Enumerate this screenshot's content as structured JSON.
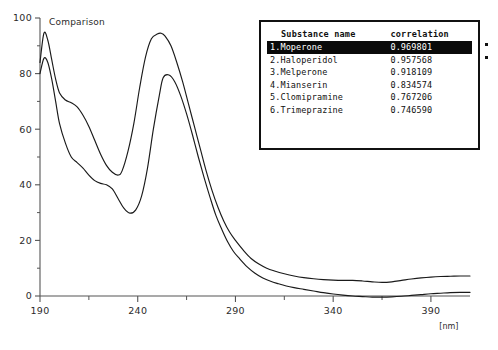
{
  "chart_data": {
    "type": "line",
    "title": "Comparison",
    "xlabel": "[nm]",
    "ylabel": "",
    "xlim": [
      190,
      410
    ],
    "ylim": [
      0,
      100
    ],
    "grid": false,
    "legend_position": "none",
    "x_ticks": [
      190,
      240,
      290,
      340,
      390
    ],
    "x_minor_step": 25,
    "y_ticks": [
      0,
      20,
      40,
      60,
      80,
      100
    ],
    "y_minor_step": 10,
    "series": [
      {
        "name": "Moperone (reference, upper)",
        "color": "#1a1a1a",
        "x": [
          190,
          192,
          194,
          196,
          198,
          200,
          203,
          206,
          209,
          212,
          215,
          218,
          221,
          224,
          227,
          230,
          232,
          235,
          238,
          241,
          244,
          247,
          250,
          252,
          254,
          257,
          260,
          263,
          266,
          269,
          272,
          275,
          278,
          281,
          284,
          287,
          290,
          294,
          298,
          302,
          306,
          310,
          315,
          320,
          325,
          330,
          335,
          340,
          345,
          350,
          355,
          360,
          365,
          370,
          375,
          380,
          385,
          390,
          395,
          400,
          405,
          410
        ],
        "y": [
          84,
          94.5,
          92,
          85,
          78,
          73,
          70.5,
          69.5,
          68,
          65,
          61,
          56,
          51,
          47,
          44.5,
          43.5,
          45,
          52,
          62,
          75,
          86,
          92.5,
          94.2,
          94.5,
          93.5,
          90,
          84,
          77,
          69,
          61,
          53,
          45,
          38,
          32,
          27,
          23,
          20,
          16.5,
          13.5,
          11.5,
          10,
          9,
          8,
          7.2,
          6.6,
          6.2,
          5.9,
          5.7,
          5.6,
          5.6,
          5.4,
          5.1,
          4.9,
          5.1,
          5.6,
          6.1,
          6.5,
          6.8,
          7.0,
          7.1,
          7.2,
          7.2
        ]
      },
      {
        "name": "Haloperidol (sample, lower)",
        "color": "#1a1a1a",
        "x": [
          190,
          192,
          194,
          196,
          198,
          200,
          203,
          206,
          209,
          212,
          215,
          218,
          221,
          224,
          227,
          230,
          233,
          236,
          239,
          242,
          245,
          248,
          251,
          253,
          256,
          259,
          262,
          265,
          268,
          271,
          274,
          277,
          280,
          283,
          286,
          289,
          292,
          296,
          300,
          304,
          308,
          312,
          316,
          320,
          325,
          330,
          335,
          340,
          345,
          350,
          355,
          360,
          365,
          370,
          375,
          380,
          385,
          390,
          395,
          400,
          405,
          410
        ],
        "y": [
          80,
          85.5,
          84,
          78,
          70,
          62,
          55,
          50,
          48,
          46,
          43.5,
          41.5,
          40.5,
          40,
          38.5,
          35,
          31.5,
          29.8,
          31,
          36,
          46,
          60,
          72,
          78.5,
          79.5,
          77,
          72,
          65.5,
          58,
          50,
          42.5,
          35.5,
          29,
          24,
          19.5,
          16,
          13.5,
          10.5,
          8.2,
          6.5,
          5.3,
          4.4,
          3.6,
          3.0,
          2.4,
          1.8,
          1.2,
          0.7,
          0.3,
          0.0,
          -0.2,
          -0.4,
          -0.4,
          -0.3,
          -0.1,
          0.2,
          0.5,
          0.8,
          1.0,
          1.2,
          1.3,
          1.3
        ]
      }
    ]
  },
  "results_panel": {
    "columns": {
      "substance_name": "Substance name",
      "correlation": "correlation"
    },
    "rows": [
      {
        "label": "1.Moperone",
        "correlation": "0.969801",
        "selected": true,
        "marker": true
      },
      {
        "label": "2.Haloperidol",
        "correlation": "0.957568",
        "selected": false,
        "marker": true
      },
      {
        "label": "3.Melperone",
        "correlation": "0.918109",
        "selected": false,
        "marker": false
      },
      {
        "label": "4.Mianserin",
        "correlation": "0.834574",
        "selected": false,
        "marker": false
      },
      {
        "label": "5.Clomipramine",
        "correlation": "0.767206",
        "selected": false,
        "marker": false
      },
      {
        "label": "6.Trimeprazine",
        "correlation": "0.746590",
        "selected": false,
        "marker": false
      }
    ]
  },
  "colors": {
    "curve": "#1a1a1a",
    "axis": "#555555",
    "panel_border": "#111111",
    "selected_bg": "#0a0a0a",
    "selected_fg": "#ffffff",
    "background": "#ffffff"
  }
}
